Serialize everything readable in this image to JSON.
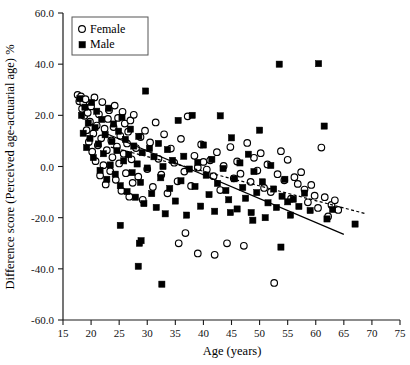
{
  "chart_data": {
    "type": "scatter",
    "title": "",
    "xlabel": "Age (years)",
    "ylabel": "Difference score (Perceived age-actuarial age) %",
    "xlim": [
      15,
      75
    ],
    "ylim": [
      -60,
      60
    ],
    "xticks": [
      15,
      20,
      25,
      30,
      35,
      40,
      45,
      50,
      55,
      60,
      65,
      70,
      75
    ],
    "xticklabels": [
      "15",
      "20",
      "25",
      "30",
      "35",
      "40",
      "45",
      "50",
      "55",
      "60",
      "65",
      "70",
      "75"
    ],
    "yticks": [
      60,
      40,
      20,
      0,
      -20,
      -40,
      -60
    ],
    "yticklabels": [
      "60.0",
      "40.0",
      "20.0",
      "0.0",
      "-20.0",
      "-40.0",
      "-60.0"
    ],
    "grid": false,
    "legend_position": "top-left",
    "legend": [
      {
        "name": "Female",
        "marker": "open-circle",
        "color": "#ffffff",
        "edge": "#000000"
      },
      {
        "name": "Male",
        "marker": "filled-square",
        "color": "#000000",
        "edge": "#000000"
      }
    ],
    "series": [
      {
        "name": "Female",
        "marker": "open-circle",
        "points": [
          [
            17.6,
            28.0
          ],
          [
            17.9,
            25.5
          ],
          [
            18.2,
            27.4
          ],
          [
            18.4,
            22.6
          ],
          [
            18.6,
            24.9
          ],
          [
            18.8,
            19.8
          ],
          [
            19.0,
            26.3
          ],
          [
            19.2,
            14.2
          ],
          [
            19.4,
            21.0
          ],
          [
            19.6,
            9.6
          ],
          [
            19.8,
            17.5
          ],
          [
            20.0,
            23.5
          ],
          [
            20.2,
            5.8
          ],
          [
            20.4,
            12.9
          ],
          [
            20.6,
            27.0
          ],
          [
            20.8,
            2.1
          ],
          [
            21.0,
            16.0
          ],
          [
            21.2,
            8.3
          ],
          [
            21.4,
            20.4
          ],
          [
            21.6,
            -3.5
          ],
          [
            21.8,
            11.0
          ],
          [
            22.0,
            25.2
          ],
          [
            22.2,
            0.5
          ],
          [
            22.4,
            14.8
          ],
          [
            22.6,
            -7.0
          ],
          [
            22.8,
            6.4
          ],
          [
            23.0,
            18.6
          ],
          [
            23.2,
            22.0
          ],
          [
            23.4,
            -1.8
          ],
          [
            23.6,
            10.2
          ],
          [
            23.8,
            3.6
          ],
          [
            24.0,
            15.4
          ],
          [
            24.2,
            23.8
          ],
          [
            24.4,
            -5.2
          ],
          [
            24.6,
            7.8
          ],
          [
            24.8,
            19.0
          ],
          [
            25.0,
            1.2
          ],
          [
            25.2,
            12.0
          ],
          [
            25.4,
            -9.5
          ],
          [
            25.6,
            21.4
          ],
          [
            25.8,
            5.0
          ],
          [
            26.0,
            16.8
          ],
          [
            26.2,
            -2.6
          ],
          [
            26.4,
            9.0
          ],
          [
            26.6,
            13.6
          ],
          [
            26.8,
            -11.8
          ],
          [
            27.0,
            18.0
          ],
          [
            27.2,
            2.8
          ],
          [
            27.4,
            -6.4
          ],
          [
            27.6,
            20.2
          ],
          [
            28.0,
            7.2
          ],
          [
            28.4,
            -4.0
          ],
          [
            28.8,
            11.5
          ],
          [
            29.2,
            -13.0
          ],
          [
            29.6,
            14.0
          ],
          [
            30.0,
            -1.0
          ],
          [
            30.5,
            9.4
          ],
          [
            31.0,
            -8.0
          ],
          [
            31.5,
            17.2
          ],
          [
            32.0,
            3.0
          ],
          [
            32.5,
            -3.2
          ],
          [
            33.0,
            12.6
          ],
          [
            33.6,
            -10.5
          ],
          [
            34.2,
            7.0
          ],
          [
            34.8,
            1.5
          ],
          [
            35.4,
            -5.8
          ],
          [
            36.0,
            10.8
          ],
          [
            36.6,
            -2.0
          ],
          [
            37.2,
            19.6
          ],
          [
            37.8,
            -7.6
          ],
          [
            38.4,
            4.2
          ],
          [
            39.0,
            -0.4
          ],
          [
            39.6,
            8.6
          ],
          [
            40.0,
            1.8
          ],
          [
            40.6,
            -1.2
          ],
          [
            41.2,
            2.4
          ],
          [
            41.8,
            -3.8
          ],
          [
            42.4,
            5.6
          ],
          [
            43.0,
            -9.2
          ],
          [
            43.6,
            0.2
          ],
          [
            44.2,
            -30.0
          ],
          [
            44.8,
            7.6
          ],
          [
            45.4,
            -4.6
          ],
          [
            46.0,
            2.0
          ],
          [
            46.6,
            -2.8
          ],
          [
            47.2,
            -31.0
          ],
          [
            47.8,
            9.2
          ],
          [
            48.4,
            -6.0
          ],
          [
            49.0,
            3.4
          ],
          [
            49.6,
            -1.6
          ],
          [
            50.2,
            5.2
          ],
          [
            50.8,
            -8.4
          ],
          [
            51.4,
            0.8
          ],
          [
            52.0,
            -10.0
          ],
          [
            52.6,
            -45.5
          ],
          [
            53.2,
            -3.0
          ],
          [
            53.8,
            6.0
          ],
          [
            54.4,
            -5.4
          ],
          [
            55.0,
            2.6
          ],
          [
            55.6,
            -12.6
          ],
          [
            56.2,
            -4.2
          ],
          [
            56.8,
            -6.8
          ],
          [
            57.4,
            -2.2
          ],
          [
            58.0,
            -9.0
          ],
          [
            58.6,
            -14.0
          ],
          [
            59.2,
            -7.2
          ],
          [
            59.8,
            -11.4
          ],
          [
            60.4,
            -16.2
          ],
          [
            61.0,
            7.4
          ],
          [
            61.6,
            -12.0
          ],
          [
            62.2,
            -19.5
          ],
          [
            62.8,
            -15.0
          ],
          [
            63.4,
            -13.2
          ],
          [
            64.0,
            -17.0
          ],
          [
            36.8,
            -26.0
          ],
          [
            35.6,
            -30.0
          ],
          [
            39.0,
            -34.0
          ],
          [
            42.0,
            -34.5
          ]
        ]
      },
      {
        "name": "Male",
        "marker": "filled-square",
        "points": [
          [
            18.0,
            26.5
          ],
          [
            18.3,
            20.0
          ],
          [
            18.6,
            13.0
          ],
          [
            18.9,
            23.2
          ],
          [
            19.2,
            7.4
          ],
          [
            19.5,
            17.0
          ],
          [
            19.8,
            11.0
          ],
          [
            20.1,
            25.0
          ],
          [
            20.4,
            3.5
          ],
          [
            20.7,
            15.2
          ],
          [
            21.0,
            21.6
          ],
          [
            21.3,
            8.8
          ],
          [
            21.6,
            -1.5
          ],
          [
            21.9,
            18.4
          ],
          [
            22.2,
            5.0
          ],
          [
            22.5,
            12.4
          ],
          [
            22.8,
            -5.0
          ],
          [
            23.1,
            22.8
          ],
          [
            23.4,
            0.6
          ],
          [
            23.7,
            9.8
          ],
          [
            24.0,
            16.6
          ],
          [
            24.3,
            -3.0
          ],
          [
            24.6,
            6.2
          ],
          [
            24.9,
            13.8
          ],
          [
            25.2,
            -7.5
          ],
          [
            25.5,
            19.2
          ],
          [
            25.8,
            2.2
          ],
          [
            26.1,
            10.6
          ],
          [
            26.4,
            -9.8
          ],
          [
            26.7,
            4.6
          ],
          [
            27.0,
            14.6
          ],
          [
            27.3,
            -2.4
          ],
          [
            27.6,
            8.0
          ],
          [
            27.9,
            -12.0
          ],
          [
            28.2,
            1.0
          ],
          [
            28.5,
            11.8
          ],
          [
            28.8,
            -6.2
          ],
          [
            29.1,
            5.4
          ],
          [
            29.4,
            -14.5
          ],
          [
            29.7,
            29.5
          ],
          [
            30.0,
            -0.6
          ],
          [
            30.4,
            7.0
          ],
          [
            30.8,
            -10.6
          ],
          [
            31.2,
            3.8
          ],
          [
            31.6,
            -16.0
          ],
          [
            32.0,
            9.0
          ],
          [
            32.4,
            -4.4
          ],
          [
            32.8,
            0.0
          ],
          [
            33.2,
            -18.5
          ],
          [
            33.6,
            6.6
          ],
          [
            34.0,
            -8.6
          ],
          [
            34.5,
            2.4
          ],
          [
            35.0,
            -13.5
          ],
          [
            35.5,
            18.0
          ],
          [
            36.0,
            -5.6
          ],
          [
            36.5,
            4.0
          ],
          [
            37.0,
            -19.0
          ],
          [
            37.5,
            -1.0
          ],
          [
            38.0,
            20.0
          ],
          [
            38.5,
            -7.8
          ],
          [
            39.0,
            1.6
          ],
          [
            39.5,
            -15.5
          ],
          [
            40.0,
            8.4
          ],
          [
            40.5,
            -3.4
          ],
          [
            41.0,
            -11.0
          ],
          [
            41.5,
            2.8
          ],
          [
            42.0,
            -17.5
          ],
          [
            42.5,
            -6.6
          ],
          [
            43.0,
            19.8
          ],
          [
            43.5,
            -0.8
          ],
          [
            44.0,
            -9.4
          ],
          [
            44.5,
            -13.0
          ],
          [
            45.0,
            11.2
          ],
          [
            45.5,
            -4.8
          ],
          [
            46.0,
            -16.6
          ],
          [
            46.5,
            1.4
          ],
          [
            47.0,
            -8.2
          ],
          [
            47.5,
            -12.4
          ],
          [
            48.0,
            4.8
          ],
          [
            48.5,
            -18.0
          ],
          [
            49.0,
            -2.0
          ],
          [
            49.5,
            -10.2
          ],
          [
            50.0,
            14.2
          ],
          [
            50.5,
            -6.0
          ],
          [
            51.0,
            -20.0
          ],
          [
            51.5,
            -14.2
          ],
          [
            52.0,
            0.4
          ],
          [
            52.5,
            -8.8
          ],
          [
            53.0,
            -16.0
          ],
          [
            53.5,
            40.0
          ],
          [
            54.0,
            -11.6
          ],
          [
            54.5,
            -5.0
          ],
          [
            55.0,
            -13.8
          ],
          [
            55.5,
            -19.0
          ],
          [
            56.0,
            -12.8
          ],
          [
            57.0,
            -15.6
          ],
          [
            58.0,
            -10.4
          ],
          [
            59.0,
            -17.2
          ],
          [
            60.5,
            40.2
          ],
          [
            61.5,
            15.8
          ],
          [
            62.0,
            -20.5
          ],
          [
            63.0,
            -16.8
          ],
          [
            67.0,
            -22.5
          ],
          [
            25.2,
            -23.0
          ],
          [
            28.6,
            -30.0
          ],
          [
            28.9,
            -29.0
          ],
          [
            28.4,
            -39.0
          ],
          [
            32.6,
            -46.0
          ],
          [
            53.8,
            -31.5
          ],
          [
            44.8,
            -18.0
          ],
          [
            48.8,
            -21.0
          ]
        ]
      }
    ],
    "fit_lines": [
      {
        "name": "Male fit",
        "style": "solid",
        "x_start": 23.0,
        "y_start": 12.6,
        "x_end": 65.0,
        "y_end": -26.5
      },
      {
        "name": "Female fit",
        "style": "dashed",
        "x_start": 23.5,
        "y_start": 7.6,
        "x_end": 69.0,
        "y_end": -18.5
      }
    ]
  },
  "axes": {
    "x_title": "Age (years)",
    "y_title": "Difference score (Perceived age-actuarial age) %"
  },
  "legend": {
    "female_label": "Female",
    "male_label": "Male"
  }
}
